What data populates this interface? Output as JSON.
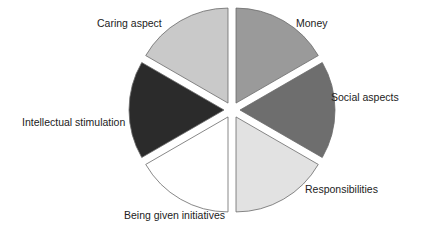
{
  "chart_data": {
    "type": "pie",
    "title": "",
    "exploded": true,
    "legend": "none",
    "categories": [
      "Money",
      "Social aspects",
      "Responsibilities",
      "Being given initiatives",
      "Intellectual stimulation",
      "Caring aspect"
    ],
    "values": [
      16.67,
      16.67,
      16.67,
      16.67,
      16.67,
      16.67
    ],
    "value_note": "No values shown; slices appear approximately equal",
    "slices": [
      {
        "label": "Money",
        "start_deg": 90,
        "end_deg": 30,
        "color": "#9a9a9a",
        "label_x": 296,
        "label_y": 27,
        "anchor": "start"
      },
      {
        "label": "Social aspects",
        "start_deg": 30,
        "end_deg": -30,
        "color": "#6e6e6e",
        "label_x": 331,
        "label_y": 101,
        "anchor": "start"
      },
      {
        "label": "Responsibilities",
        "start_deg": -30,
        "end_deg": -90,
        "color": "#e2e2e2",
        "label_x": 305,
        "label_y": 193,
        "anchor": "start"
      },
      {
        "label": "Being given initiatives",
        "start_deg": -90,
        "end_deg": -150,
        "color": "#ffffff",
        "label_x": 124,
        "label_y": 219,
        "anchor": "start"
      },
      {
        "label": "Intellectual stimulation",
        "start_deg": -150,
        "end_deg": -210,
        "color": "#2b2b2b",
        "label_x": 22,
        "label_y": 126,
        "anchor": "start"
      },
      {
        "label": "Caring aspect",
        "start_deg": 150,
        "end_deg": 90,
        "color": "#c9c9c9",
        "label_x": 97,
        "label_y": 27,
        "anchor": "start"
      }
    ],
    "geometry": {
      "cx": 232,
      "cy": 110,
      "r": 95,
      "explode": 8
    }
  }
}
